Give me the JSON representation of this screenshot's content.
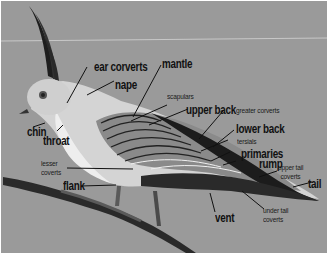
{
  "diagram": {
    "background_color": "#9a9a9a",
    "label_color": "#111111",
    "labels": {
      "ear_coverts": "ear corverts",
      "mantle": "mantle",
      "nape": "nape",
      "scapulars": "scapulars",
      "upper_back": "upper back",
      "greater_coverts": "greater corverts",
      "chin": "chin",
      "throat": "throat",
      "lower_back": "lower back",
      "tersials": "tersials",
      "primaries": "primaries",
      "rump": "rump",
      "upper_tail_coverts_1": "upper tail",
      "upper_tail_coverts_2": "coverts",
      "lesser_coverts_1": "lesser",
      "lesser_coverts_2": "coverts",
      "tail": "tail",
      "flank": "flank",
      "vent": "vent",
      "under_tail_coverts_1": "under tail",
      "under_tail_coverts_2": "coverts"
    }
  }
}
